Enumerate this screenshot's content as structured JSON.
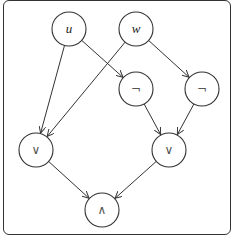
{
  "diagram": {
    "type": "boolean-circuit",
    "nodes": [
      {
        "id": "u",
        "label": "u",
        "kind": "variable",
        "x": 69,
        "y": 29
      },
      {
        "id": "w",
        "label": "w",
        "kind": "variable",
        "x": 136,
        "y": 29
      },
      {
        "id": "not1",
        "label": "¬",
        "kind": "operator",
        "x": 136,
        "y": 89
      },
      {
        "id": "not2",
        "label": "¬",
        "kind": "operator",
        "x": 202,
        "y": 89
      },
      {
        "id": "or1",
        "label": "∨",
        "kind": "operator",
        "x": 36,
        "y": 150
      },
      {
        "id": "or2",
        "label": "∨",
        "kind": "operator",
        "x": 169,
        "y": 150
      },
      {
        "id": "and",
        "label": "∧",
        "kind": "operator",
        "x": 102,
        "y": 210
      }
    ],
    "edges": [
      {
        "from": "u",
        "to": "or1"
      },
      {
        "from": "u",
        "to": "not1"
      },
      {
        "from": "w",
        "to": "or1"
      },
      {
        "from": "w",
        "to": "not2"
      },
      {
        "from": "not1",
        "to": "or2"
      },
      {
        "from": "not2",
        "to": "or2"
      },
      {
        "from": "or1",
        "to": "and"
      },
      {
        "from": "or2",
        "to": "and"
      }
    ],
    "node_radius": 17,
    "stroke_color": "#333333"
  }
}
